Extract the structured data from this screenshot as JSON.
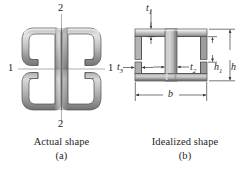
{
  "figure": {
    "panel_a": {
      "caption_title": "Actual shape",
      "caption_sub": "(a)",
      "axis_labels": {
        "top": "2",
        "bottom": "2",
        "left": "1",
        "right": "1"
      },
      "shape_name": "back-to-back-channel-section",
      "colors": {
        "steel_light": "#d6d6d6",
        "steel_mid": "#a9a9a9",
        "steel_dark": "#6e6e6e",
        "outline": "#4a4a4a",
        "axis_line": "#8a8a8a"
      }
    },
    "panel_b": {
      "caption_title": "Idealized shape",
      "caption_sub": "(b)",
      "shape_name": "idealized-i-section",
      "dimensions": [
        {
          "symbol": "t",
          "subscript": "1",
          "name": "flange-thickness",
          "orientation": "vertical"
        },
        {
          "symbol": "t",
          "subscript": "2",
          "name": "web-thickness",
          "orientation": "horizontal"
        },
        {
          "symbol": "t",
          "subscript": "3",
          "name": "lower-flange-thickness",
          "orientation": "horizontal"
        },
        {
          "symbol": "h",
          "subscript": "1",
          "name": "web-clear-height",
          "orientation": "vertical"
        },
        {
          "symbol": "h",
          "subscript": "",
          "name": "overall-height",
          "orientation": "vertical"
        },
        {
          "symbol": "b",
          "subscript": "",
          "name": "overall-width",
          "orientation": "horizontal"
        }
      ],
      "colors": {
        "steel_light": "#d8d8d8",
        "steel_mid": "#ababab",
        "steel_dark": "#717171",
        "outline": "#4a4a4a",
        "dim_line": "#4d4d4d"
      }
    }
  }
}
